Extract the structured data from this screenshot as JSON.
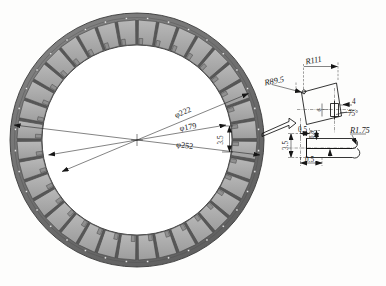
{
  "drawing": {
    "title": "Stator lamination ring with magnet slot detail",
    "background_color": "#fdfdfc",
    "ring_view": {
      "name": "ring-assembly-view",
      "outer_ring_color": "#6e6e6e",
      "segment_color": "#a9a9a9",
      "segment_count": 36,
      "dimensions": [
        {
          "id": "dia-222",
          "label": "φ222",
          "value": 222,
          "kind": "diameter"
        },
        {
          "id": "dia-179",
          "label": "φ179",
          "value": 179,
          "kind": "diameter"
        },
        {
          "id": "dia-252",
          "label": "φ252",
          "value": 252,
          "kind": "diameter"
        },
        {
          "id": "len-3-5",
          "label": "3.5",
          "value": 3.5,
          "kind": "linear"
        }
      ]
    },
    "detail_view": {
      "name": "magnet-slot-detail-view",
      "callout_icon": "arrow-right-icon",
      "dimensions": [
        {
          "id": "rad-111",
          "label": "R111",
          "value": 111,
          "kind": "radius"
        },
        {
          "id": "rad-89-5",
          "label": "R89.5",
          "value": 89.5,
          "kind": "radius"
        },
        {
          "id": "rad-1-75",
          "label": "R1.75",
          "value": 1.75,
          "kind": "radius"
        },
        {
          "id": "len-4",
          "label": "4",
          "value": 4,
          "kind": "linear"
        },
        {
          "id": "ang-75",
          "label": "75°",
          "value": 75,
          "kind": "angle"
        },
        {
          "id": "len-6",
          "label": "6",
          "value": 6,
          "kind": "linear"
        },
        {
          "id": "len-0-5-top",
          "label": "0.5",
          "value": 0.5,
          "kind": "linear"
        },
        {
          "id": "len-0-5-bottom",
          "label": "0.5",
          "value": 0.5,
          "kind": "linear"
        },
        {
          "id": "len-0-8",
          "label": "0.8",
          "value": 0.8,
          "kind": "linear"
        },
        {
          "id": "len-3-5",
          "label": "3.5",
          "value": 3.5,
          "kind": "linear"
        }
      ]
    }
  }
}
